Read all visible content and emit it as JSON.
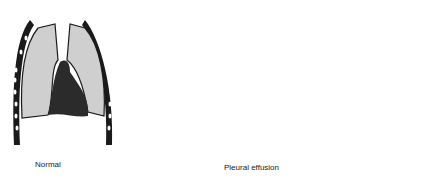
{
  "diagram": {
    "panels": [
      {
        "id": "normal",
        "label": "Normal"
      },
      {
        "id": "effusion",
        "label": "Pleural effusion"
      },
      {
        "id": "magnified",
        "label": ""
      }
    ],
    "colors": {
      "lung_fill": "#cfcfcf",
      "heart_fill": "#2b2b2b",
      "rib_outline": "#1a1a1a",
      "callout_circle": "#9a9a9a",
      "background": "#ffffff"
    }
  }
}
